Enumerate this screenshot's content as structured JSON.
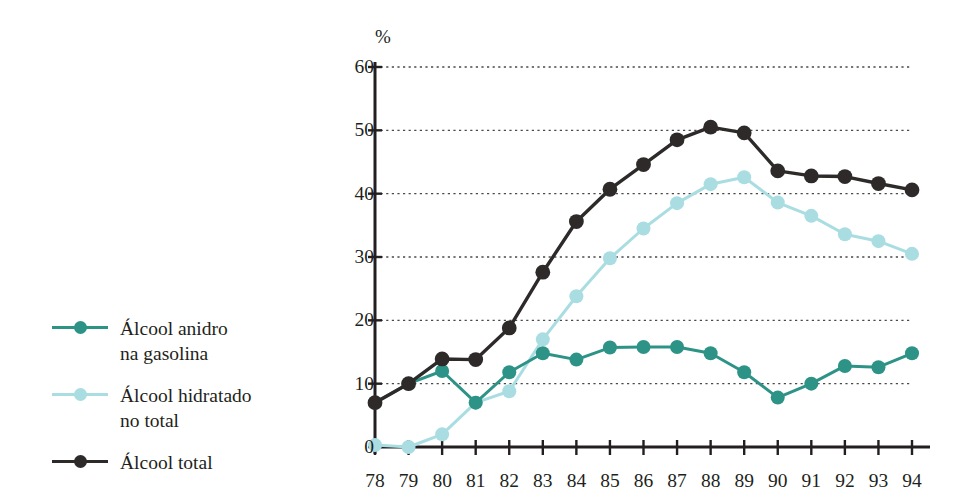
{
  "chart_data": {
    "type": "line",
    "title": "",
    "subtitle": "",
    "xlabel": "",
    "ylabel": "%",
    "ylim": [
      0,
      60
    ],
    "yticks": [
      0,
      10,
      20,
      30,
      40,
      50,
      60
    ],
    "grid": true,
    "legend_position": "left",
    "categories": [
      "78",
      "79",
      "80",
      "81",
      "82",
      "83",
      "84",
      "85",
      "86",
      "87",
      "88",
      "89",
      "90",
      "91",
      "92",
      "93",
      "94"
    ],
    "x": [
      78,
      79,
      80,
      81,
      82,
      83,
      84,
      85,
      86,
      87,
      88,
      89,
      90,
      91,
      92,
      93,
      94
    ],
    "series": [
      {
        "name": "Álcool anidro na gasolina",
        "color": "#2e9387",
        "values": [
          7.0,
          10.0,
          12.0,
          7.0,
          11.8,
          14.8,
          13.8,
          15.7,
          15.8,
          15.8,
          14.8,
          11.8,
          7.8,
          10.0,
          12.8,
          12.6,
          14.8
        ]
      },
      {
        "name": "Álcool hidratado no total",
        "color": "#a9dde2",
        "values": [
          0.3,
          0.0,
          2.0,
          7.0,
          8.8,
          17.0,
          23.8,
          29.8,
          34.5,
          38.5,
          41.5,
          42.6,
          38.6,
          36.5,
          33.6,
          32.5,
          30.5
        ]
      },
      {
        "name": "Álcool total",
        "color": "#2e2a2a",
        "values": [
          7.0,
          10.0,
          13.9,
          13.8,
          18.8,
          27.6,
          35.6,
          40.7,
          44.6,
          48.5,
          50.5,
          49.6,
          43.6,
          42.8,
          42.7,
          41.6,
          40.6
        ]
      }
    ]
  },
  "legend": {
    "items": [
      {
        "label": "Álcool anidro\nna gasolina",
        "color": "#2e9387",
        "icon": "line-marker-icon"
      },
      {
        "label": "Álcool hidratado\nno total",
        "color": "#a9dde2",
        "icon": "line-marker-icon"
      },
      {
        "label": "Álcool total",
        "color": "#2e2a2a",
        "icon": "line-marker-icon"
      }
    ]
  },
  "axes": {
    "y_unit_label": "%",
    "y_tick_labels": [
      "60",
      "50",
      "40",
      "30",
      "20",
      "10",
      "0"
    ],
    "x_tick_labels": [
      "78",
      "79",
      "80",
      "81",
      "82",
      "83",
      "84",
      "85",
      "86",
      "87",
      "88",
      "89",
      "90",
      "91",
      "92",
      "93",
      "94"
    ]
  }
}
